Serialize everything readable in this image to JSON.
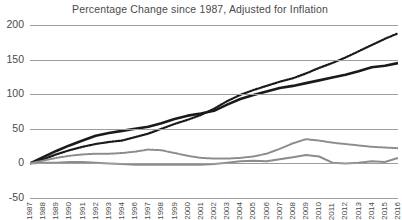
{
  "chart_data": {
    "type": "line",
    "title": "Percentage Change since 1987, Adjusted for Inflation",
    "xlabel": "",
    "ylabel": "",
    "ylim": [
      -50,
      200
    ],
    "yticks": [
      200,
      150,
      100,
      50,
      0,
      -50
    ],
    "ytick_labels": [
      "200",
      "150",
      "100",
      "50",
      "0",
      "-50"
    ],
    "grid": true,
    "legend": "none",
    "categories": [
      "1987",
      "1988",
      "1989",
      "1990",
      "1991",
      "1992",
      "1993",
      "1994",
      "1996",
      "1997",
      "1998",
      "1999",
      "2000",
      "2001",
      "2002",
      "2003",
      "2004",
      "2005",
      "2006",
      "2007",
      "2008",
      "2009",
      "2010",
      "2011",
      "2012",
      "2013",
      "2014",
      "2015",
      "2016"
    ],
    "series": [
      {
        "name": "series-black-dotted",
        "style": "dotted",
        "color": "#1a1a1a",
        "width": 2.2,
        "values": [
          0,
          6,
          13,
          19,
          24,
          28,
          31,
          33,
          38,
          43,
          50,
          57,
          63,
          70,
          79,
          90,
          99,
          106,
          112,
          118,
          123,
          130,
          138,
          145,
          153,
          162,
          171,
          180,
          188
        ]
      },
      {
        "name": "series-black-solid",
        "style": "solid",
        "color": "#1a1a1a",
        "width": 2.6,
        "values": [
          0,
          9,
          18,
          26,
          33,
          40,
          44,
          47,
          50,
          53,
          58,
          64,
          69,
          72,
          76,
          85,
          93,
          99,
          104,
          109,
          112,
          116,
          120,
          124,
          128,
          133,
          139,
          141,
          145
        ]
      },
      {
        "name": "series-gray-dotted",
        "style": "dotted",
        "color": "#8c8c8c",
        "width": 2.0,
        "values": [
          0,
          4,
          8,
          11,
          13,
          14,
          14,
          15,
          17,
          20,
          19,
          15,
          11,
          8,
          7,
          7,
          8,
          10,
          14,
          21,
          29,
          35,
          33,
          30,
          28,
          26,
          24,
          23,
          22
        ]
      },
      {
        "name": "series-gray-solid",
        "style": "solid",
        "color": "#8c8c8c",
        "width": 2.0,
        "values": [
          0,
          1,
          1,
          2,
          2,
          1,
          0,
          -1,
          -2,
          -2,
          -2,
          -2,
          -2,
          -2,
          -1,
          1,
          3,
          4,
          3,
          6,
          9,
          12,
          10,
          1,
          0,
          1,
          3,
          2,
          8
        ]
      }
    ]
  }
}
